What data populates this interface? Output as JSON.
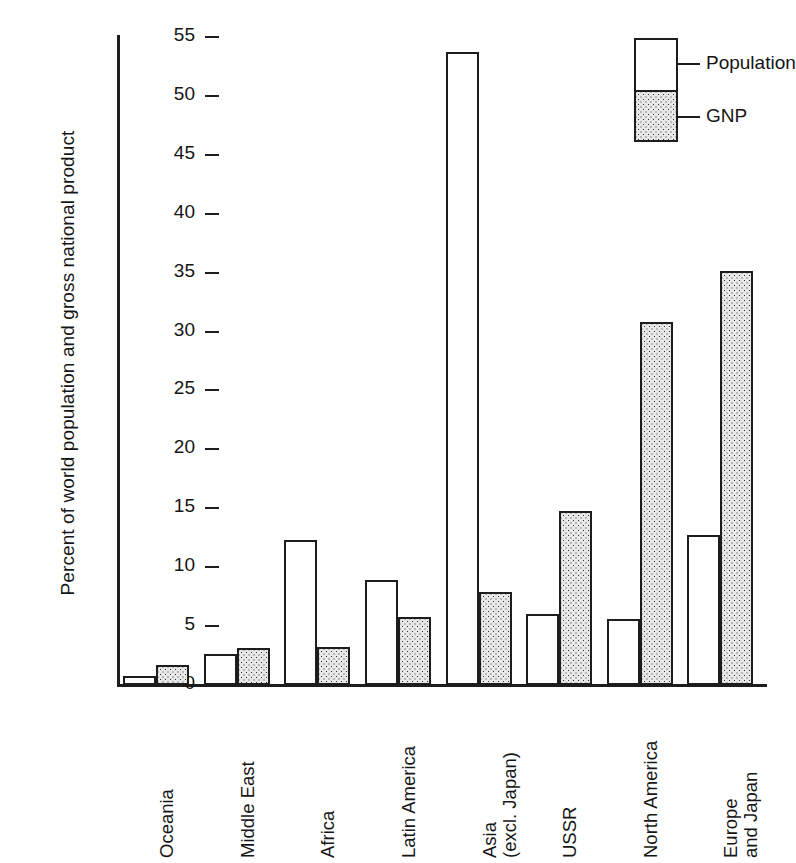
{
  "chart_data": {
    "type": "bar",
    "title": "",
    "xlabel": "",
    "ylabel": "Percent of world population and gross national product",
    "ylim": [
      0,
      55
    ],
    "yticks": [
      0,
      5,
      10,
      15,
      20,
      25,
      30,
      35,
      40,
      45,
      50,
      55
    ],
    "grid": false,
    "legend_position": "top-right",
    "categories": [
      "Oceania",
      "Middle East",
      "Africa",
      "Latin America",
      "Asia (excl. Japan)",
      "USSR",
      "North America",
      "Europe and Japan"
    ],
    "category_lines": [
      [
        "Oceania"
      ],
      [
        "Middle East"
      ],
      [
        "Africa"
      ],
      [
        "Latin America"
      ],
      [
        "Asia",
        "(excl. Japan)"
      ],
      [
        "USSR"
      ],
      [
        "North America"
      ],
      [
        "Europe",
        "and Japan"
      ]
    ],
    "series": [
      {
        "name": "Population",
        "fill": "white",
        "values": [
          0.8,
          2.6,
          12.3,
          8.9,
          53.7,
          6.0,
          5.6,
          12.7
        ]
      },
      {
        "name": "GNP",
        "fill": "stippled",
        "values": [
          1.7,
          3.1,
          3.2,
          5.8,
          7.9,
          14.8,
          30.8,
          35.1
        ]
      }
    ]
  },
  "legend": {
    "items": [
      {
        "label": "Population"
      },
      {
        "label": "GNP"
      }
    ]
  },
  "colors": {
    "ink": "#1d1d1d",
    "background": "#ffffff",
    "stipple_base": "#e8e8e8",
    "stipple_dot": "#2b2b2b"
  }
}
